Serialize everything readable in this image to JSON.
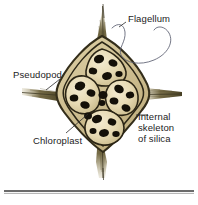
{
  "figure": {
    "organism": "silicoflagellate",
    "background_color": "#ffffff",
    "ink_color": "#1c1c1c",
    "skeleton_color": "#4a4326",
    "cell_fill_color": "#e8dcb8",
    "chloroplast_color": "#141008",
    "spine_color": "#6b6038",
    "labels": [
      {
        "id": "flagellum",
        "text": "Flagellum",
        "lines": [
          "Flagellum"
        ],
        "position": "top-right",
        "leader": "curve-to-flagellum"
      },
      {
        "id": "pseudopod",
        "text": "Pseudopod",
        "lines": [
          "Pseudopod"
        ],
        "position": "left",
        "leader": "diagonal-down-right"
      },
      {
        "id": "chloroplast",
        "text": "Chloroplast",
        "lines": [
          "Chloroplast"
        ],
        "position": "bottom-left",
        "leader": "diagonal-up-right"
      },
      {
        "id": "internal-skeleton",
        "text": "Internal skeleton of silica",
        "lines": [
          "Internal",
          "skeleton",
          "of silica"
        ],
        "position": "bottom-right",
        "leader": "horizontal-dash-left"
      }
    ],
    "structures": {
      "spine_count": 4,
      "cell_count": 4,
      "chloroplast_count": 18,
      "flagellum_count": 1
    },
    "divider": {
      "present": true,
      "orientation": "horizontal",
      "color": "#3a3a3a"
    }
  }
}
